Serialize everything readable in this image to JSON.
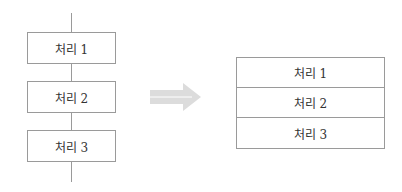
{
  "left_flow": {
    "steps": [
      {
        "label": "처리 1"
      },
      {
        "label": "처리 2"
      },
      {
        "label": "처리 3"
      }
    ]
  },
  "arrow": {
    "icon": "right-arrow-icon",
    "color": "#d9d9d9"
  },
  "right_stack": {
    "rows": [
      {
        "label": "처리 1"
      },
      {
        "label": "처리 2"
      },
      {
        "label": "처리 3"
      }
    ]
  }
}
